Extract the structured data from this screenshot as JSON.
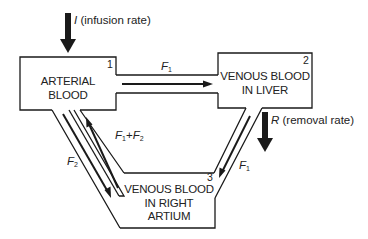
{
  "diagram": {
    "compartments": [
      {
        "id": 1,
        "number": "1",
        "line1": "ARTERIAL",
        "line2": "BLOOD",
        "line3": ""
      },
      {
        "id": 2,
        "number": "2",
        "line1": "VENOUS BLOOD",
        "line2": "IN LIVER",
        "line3": ""
      },
      {
        "id": 3,
        "number": "3",
        "line1": "VENOUS BLOOD",
        "line2": "IN RIGHT",
        "line3": "ARTIUM"
      }
    ],
    "inputs": {
      "infusion": {
        "symbol": "I",
        "text": " (infusion rate)"
      },
      "removal": {
        "symbol": "R",
        "text": " (removal rate)"
      }
    },
    "flows": {
      "arterial_to_liver": {
        "symbol": "F",
        "sub": "1"
      },
      "liver_to_atrium": {
        "symbol": "F",
        "sub": "1"
      },
      "arterial_to_atrium": {
        "symbol": "F",
        "sub": "2"
      },
      "atrium_to_arterial": {
        "symbol1": "F",
        "sub1": "1",
        "plus": "+",
        "symbol2": "F",
        "sub2": "2"
      }
    },
    "colors": {
      "line": "#1a1a1a",
      "text": "#222222",
      "background": "#ffffff"
    }
  }
}
